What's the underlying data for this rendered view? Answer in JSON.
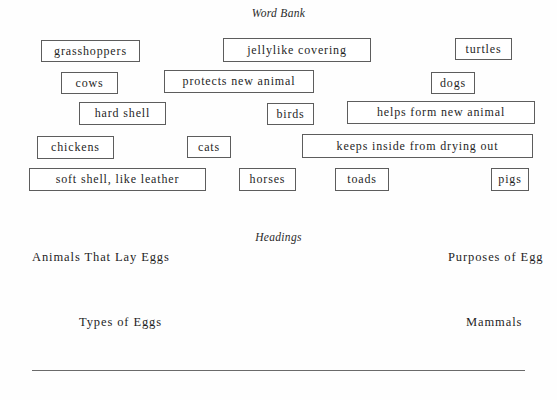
{
  "page": {
    "background_color": "#fefefe",
    "text_color": "#1f1f1f",
    "box_border_color": "#5d5d5d",
    "rule_color": "#6a6a6a"
  },
  "word_bank": {
    "title": "Word Bank",
    "items": [
      {
        "label": "grasshoppers",
        "x": 41,
        "y": 40,
        "w": 99,
        "h": 22
      },
      {
        "label": "jellylike covering",
        "x": 223,
        "y": 38,
        "w": 148,
        "h": 24
      },
      {
        "label": "turtles",
        "x": 455,
        "y": 38,
        "w": 57,
        "h": 22
      },
      {
        "label": "cows",
        "x": 61,
        "y": 72,
        "w": 57,
        "h": 22
      },
      {
        "label": "protects new animal",
        "x": 164,
        "y": 70,
        "w": 150,
        "h": 23
      },
      {
        "label": "dogs",
        "x": 431,
        "y": 72,
        "w": 44,
        "h": 22
      },
      {
        "label": "hard shell",
        "x": 79,
        "y": 102,
        "w": 87,
        "h": 23
      },
      {
        "label": "birds",
        "x": 267,
        "y": 103,
        "w": 47,
        "h": 22
      },
      {
        "label": "helps form new animal",
        "x": 347,
        "y": 101,
        "w": 188,
        "h": 23
      },
      {
        "label": "chickens",
        "x": 37,
        "y": 136,
        "w": 77,
        "h": 23
      },
      {
        "label": "cats",
        "x": 187,
        "y": 136,
        "w": 44,
        "h": 22
      },
      {
        "label": "keeps inside from drying out",
        "x": 302,
        "y": 134,
        "w": 231,
        "h": 24
      },
      {
        "label": "soft shell, like leather",
        "x": 29,
        "y": 168,
        "w": 177,
        "h": 23
      },
      {
        "label": "horses",
        "x": 239,
        "y": 168,
        "w": 57,
        "h": 23
      },
      {
        "label": "toads",
        "x": 335,
        "y": 168,
        "w": 54,
        "h": 23
      },
      {
        "label": "pigs",
        "x": 491,
        "y": 168,
        "w": 38,
        "h": 23
      }
    ]
  },
  "headings": {
    "title": "Headings",
    "items": [
      {
        "label": "Animals That Lay Eggs",
        "x": 32,
        "y": 251
      },
      {
        "label": "Purposes of Egg",
        "x": 448,
        "y": 251
      },
      {
        "label": "Types of Eggs",
        "x": 79,
        "y": 316
      },
      {
        "label": "Mammals",
        "x": 466,
        "y": 316
      }
    ]
  },
  "divider": {
    "name": "bottom-horizontal-rule"
  }
}
